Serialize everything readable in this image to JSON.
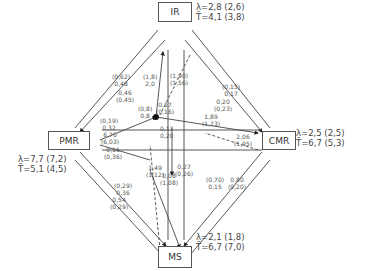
{
  "nodes": {
    "IR": {
      "label": "IR",
      "lambda": "λ=2,8 (2,6)",
      "t": "T̄=4,1 (3,8)"
    },
    "PMR": {
      "label": "PMR",
      "lambda": "λ=7,7 (7,2)",
      "t": "T̄=5,1 (4,5)"
    },
    "CMR": {
      "label": "CMR",
      "lambda": "λ=2,5 (2,5)",
      "t": "T̄=6,7 (5,3)"
    },
    "MS": {
      "label": "MS",
      "lambda": "λ=2,1 (1,8)",
      "t": "T̄=6,7 (7,0)"
    }
  },
  "edge_labels": {
    "pmr_ir_outer": [
      "(0,62)",
      "0,48"
    ],
    "pmr_ir_inner": [
      "0,46",
      "(0,45)"
    ],
    "hub_ir": [
      "(1,8)",
      "2,0"
    ],
    "ir_hub_dash": [
      "(1,90)",
      "(1,56)"
    ],
    "hub_center": [
      "(0,8)",
      "0,8"
    ],
    "hub_center2": [
      "0,17",
      "(0,16)"
    ],
    "ir_cmr_outer": [
      "(0,15)",
      "0,17"
    ],
    "ir_cmr_inner": [
      "0,20",
      "(0,23)"
    ],
    "pmr_hub_upper": [
      "(0,19)",
      "0,32"
    ],
    "pmr_hub_mid": [
      "6,70",
      "(6,03)"
    ],
    "pmr_hub_low": [
      "0,15",
      "(0,36)"
    ],
    "hub_cmr": [
      "1,89",
      "(1,73)"
    ],
    "center_down": [
      "0,17",
      "0,20"
    ],
    "cmr_hub_dash": [
      "2,06",
      "(1,95)"
    ],
    "hub_ms": [
      "0,27",
      "(0,26)"
    ],
    "pmr_ms_outer": [
      "(0,29)",
      "0,36"
    ],
    "pmr_ms_inner": [
      "0,54",
      "(0,29)"
    ],
    "ms_dash": [
      "1,49",
      "(1,12)"
    ],
    "ms_hub": [
      "0,08",
      "(1,08)"
    ],
    "cmr_ms_outer": [
      "(0,70)",
      "0,15"
    ],
    "cmr_ms_inner": [
      "0,80",
      "(0,20)"
    ]
  },
  "colors": {
    "line": "#333333",
    "box": "#555555",
    "text": "#444444"
  }
}
